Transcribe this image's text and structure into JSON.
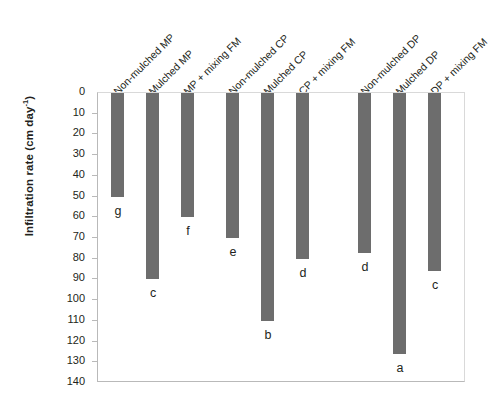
{
  "chart_data": {
    "type": "bar",
    "title": "",
    "xlabel": "",
    "ylabel": "Infiltration rate (cm day",
    "ylabel_sup": "-1",
    "ylabel_close": ")",
    "ylim": [
      0,
      140
    ],
    "y_inverted": true,
    "y_ticks": [
      0,
      10,
      20,
      30,
      40,
      50,
      60,
      70,
      80,
      90,
      100,
      110,
      120,
      130,
      140
    ],
    "y_tick_labels": [
      "0",
      "10",
      "20",
      "30",
      "40",
      "50",
      "60",
      "70",
      "80",
      "90",
      "100",
      "110",
      "120",
      "130",
      "140"
    ],
    "grid": false,
    "legend": "none",
    "categories": [
      "Non-mulched MP",
      "Mulched MP",
      "MP + mixing FM",
      "Non-mulched CP",
      "Mulched CP",
      "CP + mixing FM",
      "Non-mulched DP",
      "Mulched DP",
      "DP + mixing FM"
    ],
    "values": [
      50,
      90,
      60,
      70,
      110,
      80,
      77,
      126,
      86
    ],
    "annotations": [
      "g",
      "c",
      "f",
      "e",
      "b",
      "d",
      "d",
      "a",
      "c"
    ],
    "bar_color": "#6d6d6d",
    "groups": [
      "MP",
      "CP",
      "DP"
    ]
  },
  "bars": [
    {
      "label": "Non-mulched MP",
      "value": 50,
      "letter": "g",
      "x": 13,
      "letter_y": 8
    },
    {
      "label": "Mulched MP",
      "value": 90,
      "letter": "c",
      "x": 48,
      "letter_y": 8
    },
    {
      "label": "MP + mixing FM",
      "value": 60,
      "letter": "f",
      "x": 83,
      "letter_y": 8
    },
    {
      "label": "Non-mulched CP",
      "value": 70,
      "letter": "e",
      "x": 128,
      "letter_y": 8
    },
    {
      "label": "Mulched CP",
      "value": 110,
      "letter": "b",
      "x": 163,
      "letter_y": 8
    },
    {
      "label": "CP + mixing FM",
      "value": 80,
      "letter": "d",
      "x": 198,
      "letter_y": 8
    },
    {
      "label": "Non-mulched DP",
      "value": 77,
      "letter": "d",
      "x": 260,
      "letter_y": 8
    },
    {
      "label": "Mulched DP",
      "value": 126,
      "letter": "a",
      "x": 295,
      "letter_y": 8
    },
    {
      "label": "DP + mixing FM",
      "value": 86,
      "letter": "c",
      "x": 330,
      "letter_y": 8
    }
  ]
}
